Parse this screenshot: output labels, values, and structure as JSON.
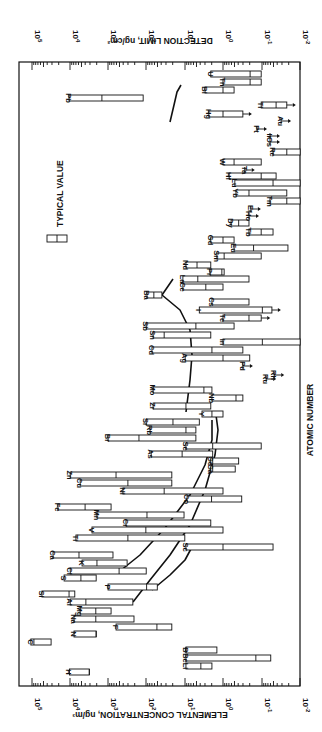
{
  "chart_data": {
    "type": "bar",
    "orientation": "rotated-90-clockwise (floating range bars, log scale)",
    "title": "",
    "xlabel": "ATOMIC NUMBER",
    "ylabel_bottom": "ELEMENTAL CONCENTRATION, ng/m3",
    "ylabel_top": "DETECTION LIMIT, ng/cm2",
    "scale": "log",
    "ylim_log10": [
      -2,
      5
    ],
    "tick_labels_bottom": [
      "10^5",
      "10^4",
      "10^3",
      "10^2",
      "10^1",
      "10^0",
      "10^-1",
      "10^-2"
    ],
    "tick_labels_top": [
      "10^5",
      "10^4",
      "10^3",
      "10^2",
      "10^1",
      "10^0",
      "10^-1",
      "10^-2"
    ],
    "legend": {
      "label": "TYPICAL VALUE",
      "marker": "range box with tick at typical value"
    },
    "annotations": [
      "curve: detection limit vs atomic number (Al -> Cl -> ... Y)",
      "curve: detection limit (P -> Sc -> ... Ba)",
      "arrows indicate upper limits (value below detection)"
    ],
    "grid": false,
    "elements": [
      {
        "el": "H",
        "y": 672,
        "lo": 4.02,
        "typ": 3.5,
        "hi": 3.5
      },
      {
        "el": "Li",
        "y": 666,
        "lo": 0.97,
        "typ": 0.58,
        "hi": 0.29
      },
      {
        "el": "Be",
        "y": 658,
        "lo": 0.97,
        "typ": -0.86,
        "hi": -1.25
      },
      {
        "el": "B",
        "y": 650,
        "lo": 0.97,
        "typ": 0.97,
        "hi": 0.16
      },
      {
        "el": "C",
        "y": 642,
        "lo": 5.03,
        "typ": 4.95,
        "hi": 4.5
      },
      {
        "el": "N",
        "y": 634,
        "lo": 3.9,
        "typ": 3.32,
        "hi": 3.32
      },
      {
        "el": "F",
        "y": 627,
        "lo": 2.8,
        "typ": 1.73,
        "hi": 1.34
      },
      {
        "el": "Na",
        "y": 619,
        "lo": 3.9,
        "typ": 3.33,
        "hi": 2.33
      },
      {
        "el": "Mg",
        "y": 611,
        "lo": 3.74,
        "typ": 3.33,
        "hi": 2.93
      },
      {
        "el": "Al",
        "y": 602,
        "lo": 4.0,
        "typ": 3.59,
        "hi": 2.36
      },
      {
        "el": "Si",
        "y": 594,
        "lo": 4.74,
        "typ": 4.03,
        "hi": 3.88
      },
      {
        "el": "S",
        "y": 578,
        "lo": 4.16,
        "typ": 3.72,
        "hi": 3.32
      },
      {
        "el": "Cl",
        "y": 571,
        "lo": 4.0,
        "typ": 2.72,
        "hi": 2.01
      },
      {
        "el": "P",
        "y": 587,
        "lo": 3.01,
        "typ": 2.0,
        "hi": 1.72
      },
      {
        "el": "K",
        "y": 563,
        "lo": 3.69,
        "typ": 3.3,
        "hi": 2.51
      },
      {
        "el": "Ca",
        "y": 555,
        "lo": 4.45,
        "typ": 3.77,
        "hi": 2.88
      },
      {
        "el": "Sc",
        "y": 547,
        "lo": 0.97,
        "typ": 0.0,
        "hi": -1.31
      },
      {
        "el": "Ti",
        "y": 538,
        "lo": 3.85,
        "typ": 2.49,
        "hi": 1.0
      },
      {
        "el": "V",
        "y": 530,
        "lo": 3.43,
        "typ": 2.02,
        "hi": 0.0
      },
      {
        "el": "Cr",
        "y": 523,
        "lo": 2.54,
        "typ": null,
        "hi": 0.32
      },
      {
        "el": "Mn",
        "y": 515,
        "lo": 3.3,
        "typ": 1.99,
        "hi": 1.02
      },
      {
        "el": "Fe",
        "y": 507,
        "lo": 4.32,
        "typ": 3.61,
        "hi": 2.93
      },
      {
        "el": "Co",
        "y": 499,
        "lo": 0.94,
        "typ": 0.3,
        "hi": -0.49
      },
      {
        "el": "Ni",
        "y": 491,
        "lo": 2.62,
        "typ": 1.54,
        "hi": 0.0
      },
      {
        "el": "Cu",
        "y": 483,
        "lo": 3.74,
        "typ": 2.49,
        "hi": 1.34
      },
      {
        "el": "Zn",
        "y": 475,
        "lo": 4.0,
        "typ": 2.8,
        "hi": 1.34
      },
      {
        "el": "Ga",
        "y": 469,
        "lo": 0.32,
        "typ": 0.27,
        "hi": -0.32
      },
      {
        "el": "Ge",
        "y": 461,
        "lo": 0.32,
        "typ": 0.27,
        "hi": -0.41
      },
      {
        "el": "As",
        "y": 454,
        "lo": 1.88,
        "typ": 1.07,
        "hi": 0.27
      },
      {
        "el": "Se",
        "y": 446,
        "lo": 0.97,
        "typ": 0.27,
        "hi": -1.0
      },
      {
        "el": "Br",
        "y": 438,
        "lo": 3.01,
        "typ": 2.2,
        "hi": 0.71
      },
      {
        "el": "Rb",
        "y": 430,
        "lo": 1.91,
        "typ": 0.97,
        "hi": 0.71
      },
      {
        "el": "Sr",
        "y": 422,
        "lo": 2.01,
        "typ": 1.31,
        "hi": 0.62
      },
      {
        "el": "Y",
        "y": 414,
        "lo": 0.55,
        "typ": 0.29,
        "hi": 0.0
      },
      {
        "el": "Zr",
        "y": 406,
        "lo": 1.83,
        "typ": 0.97,
        "hi": 0.32
      },
      {
        "el": "Nb",
        "y": 398,
        "lo": 0.29,
        "typ": -0.34,
        "hi": -0.52
      },
      {
        "el": "Mo",
        "y": 390,
        "lo": 1.83,
        "typ": 0.5,
        "hi": 0.29
      },
      {
        "el": "Ru",
        "y": 379,
        "lo": null,
        "typ": null,
        "hi": -1.13,
        "upper_limit": true
      },
      {
        "el": "Rh",
        "y": 375,
        "lo": null,
        "typ": null,
        "hi": -1.34,
        "upper_limit": true
      },
      {
        "el": "Pd",
        "y": 366,
        "lo": null,
        "typ": null,
        "hi": -0.52,
        "upper_limit": true
      },
      {
        "el": "Ag",
        "y": 358,
        "lo": 0.99,
        "typ": 0.0,
        "hi": -0.7
      },
      {
        "el": "Cd",
        "y": 350,
        "lo": 1.86,
        "typ": 0.29,
        "hi": -0.52
      },
      {
        "el": "In",
        "y": 342,
        "lo": 0.0,
        "typ": -1.03,
        "hi": -2.02
      },
      {
        "el": "Sn",
        "y": 335,
        "lo": 1.83,
        "typ": 1.54,
        "hi": 0.32
      },
      {
        "el": "Sb",
        "y": 326,
        "lo": 2.01,
        "typ": 0.71,
        "hi": -0.29
      },
      {
        "el": "Te",
        "y": 318,
        "lo": 0.0,
        "typ": -0.68,
        "hi": -1.0,
        "upper_limit": true
      },
      {
        "el": "I",
        "y": 310,
        "lo": 0.62,
        "typ": -1.03,
        "hi": -1.28,
        "upper_limit": true
      },
      {
        "el": "Cs",
        "y": 302,
        "lo": 0.29,
        "typ": null,
        "hi": -0.68
      },
      {
        "el": "Ba",
        "y": 295,
        "lo": 1.99,
        "typ": 1.81,
        "hi": 1.6
      },
      {
        "el": "La",
        "y": 279,
        "lo": 1.05,
        "typ": 0.66,
        "hi": -0.68
      },
      {
        "el": "Ce",
        "y": 287,
        "lo": 1.05,
        "typ": 0.45,
        "hi": 0.0
      },
      {
        "el": "Pr",
        "y": 272,
        "lo": 0.34,
        "typ": 0.03,
        "hi": -0.03
      },
      {
        "el": "Nd",
        "y": 265,
        "lo": 0.97,
        "typ": 0.68,
        "hi": 0.32
      },
      {
        "el": "Sm",
        "y": 256,
        "lo": 0.16,
        "typ": -0.03,
        "hi": -1.0
      },
      {
        "el": "Eu",
        "y": 248,
        "lo": -0.29,
        "typ": -0.8,
        "hi": -1.7
      },
      {
        "el": "Gd",
        "y": 240,
        "lo": 0.32,
        "typ": 0.0,
        "hi": -0.29
      },
      {
        "el": "Tb",
        "y": 232,
        "lo": -0.68,
        "typ": -1.0,
        "hi": -1.31
      },
      {
        "el": "Dy",
        "y": 223,
        "lo": -0.21,
        "typ": -0.41,
        "hi": -0.68
      },
      {
        "el": "Ho",
        "y": 216,
        "lo": null,
        "typ": null,
        "hi": -0.68,
        "upper_limit": true
      },
      {
        "el": "Er",
        "y": 209,
        "lo": null,
        "typ": null,
        "hi": -0.73,
        "upper_limit": true
      },
      {
        "el": "Tm",
        "y": 201,
        "lo": -1.23,
        "typ": -1.67,
        "hi": -2.02
      },
      {
        "el": "Yb",
        "y": 193,
        "lo": -0.34,
        "typ": -0.68,
        "hi": -1.67
      },
      {
        "el": "Lu",
        "y": 183,
        "lo": -0.31,
        "typ": -1.31,
        "hi": -2.02
      },
      {
        "el": "Hf",
        "y": 176,
        "lo": -0.16,
        "typ": -1.0,
        "hi": -1.39
      },
      {
        "el": "Ta",
        "y": 170,
        "lo": null,
        "typ": null,
        "hi": -0.57,
        "upper_limit": true
      },
      {
        "el": "W",
        "y": 162,
        "lo": 0.0,
        "typ": -0.29,
        "hi": -1.0
      },
      {
        "el": "Re",
        "y": 152,
        "lo": -1.31,
        "typ": -1.67,
        "hi": -2.02
      },
      {
        "el": "Os",
        "y": 142,
        "lo": null,
        "typ": null,
        "hi": -1.23,
        "upper_limit": true
      },
      {
        "el": "Ir",
        "y": 136,
        "lo": null,
        "typ": null,
        "hi": -1.23,
        "upper_limit": true
      },
      {
        "el": "Pt",
        "y": 129,
        "lo": null,
        "typ": null,
        "hi": -0.89,
        "upper_limit": true
      },
      {
        "el": "Au",
        "y": 121,
        "lo": null,
        "typ": null,
        "hi": -1.52,
        "upper_limit": true
      },
      {
        "el": "Hg",
        "y": 114,
        "lo": 0.37,
        "typ": 0.0,
        "hi": -0.52,
        "upper_limit": true
      },
      {
        "el": "Tl",
        "y": 105,
        "lo": -1.0,
        "typ": -1.39,
        "hi": -1.67,
        "upper_limit": true
      },
      {
        "el": "Pb",
        "y": 98,
        "lo": 4.03,
        "typ": 3.17,
        "hi": 2.09
      },
      {
        "el": "Bi",
        "y": 90,
        "lo": 0.47,
        "typ": 0.0,
        "hi": -0.29
      },
      {
        "el": "Th",
        "y": 82,
        "lo": 0.0,
        "typ": -0.71,
        "hi": -1.0
      },
      {
        "el": "U",
        "y": 74,
        "lo": 0.32,
        "typ": -0.71,
        "hi": -1.0
      }
    ]
  },
  "plot": {
    "frame": {
      "left": 19,
      "right": 300,
      "top": 62,
      "bottom": 686
    },
    "axis_x0": 32,
    "px_per_decade": 38.2,
    "log_at_x0": 5
  },
  "labels": {
    "top_axis": "DETECTION LIMIT, ng/cm²",
    "bottom_axis": "ELEMENTAL CONCENTRATION, ng/m³",
    "right_axis": "ATOMIC NUMBER",
    "legend": "TYPICAL VALUE"
  },
  "ticks": [
    {
      "exp": "5",
      "x": 32
    },
    {
      "exp": "4",
      "x": 70
    },
    {
      "exp": "3",
      "x": 108
    },
    {
      "exp": "2",
      "x": 146
    },
    {
      "exp": "1",
      "x": 185
    },
    {
      "exp": "0",
      "x": 223
    },
    {
      "exp": "-1",
      "x": 262
    },
    {
      "exp": "-2",
      "x": 300
    }
  ],
  "curves": [
    {
      "name": "detection-curve-upper",
      "points": [
        [
          133,
          602
        ],
        [
          150,
          580
        ],
        [
          170,
          555
        ],
        [
          190,
          525
        ],
        [
          205,
          490
        ],
        [
          215,
          455
        ],
        [
          218,
          430
        ],
        [
          216,
          415
        ]
      ]
    },
    {
      "name": "detection-curve-lower",
      "points": [
        [
          120,
          571
        ],
        [
          140,
          555
        ],
        [
          165,
          528
        ],
        [
          190,
          495
        ],
        [
          205,
          465
        ],
        [
          212,
          440
        ],
        [
          212,
          420
        ]
      ]
    },
    {
      "name": "detection-curve-heavy",
      "points": [
        [
          186,
          412
        ],
        [
          190,
          380
        ],
        [
          192,
          355
        ],
        [
          190,
          330
        ],
        [
          180,
          310
        ],
        [
          162,
          295
        ],
        [
          173,
          279
        ]
      ]
    },
    {
      "name": "detection-curve-top",
      "points": [
        [
          170,
          122
        ],
        [
          174,
          105
        ],
        [
          177,
          92
        ],
        [
          181,
          85
        ]
      ]
    },
    {
      "name": "detection-curve-p-sc",
      "points": [
        [
          152,
          590
        ],
        [
          170,
          575
        ],
        [
          185,
          560
        ],
        [
          192,
          547
        ]
      ]
    }
  ]
}
